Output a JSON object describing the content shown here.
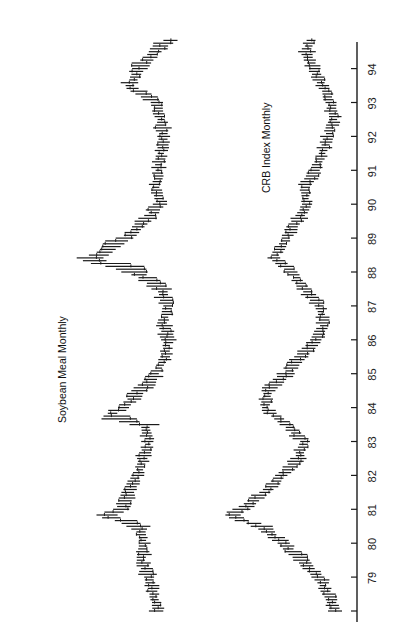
{
  "chart_data": {
    "type": "line",
    "subtype": "high-low-close bar chart (rotated 90°: time runs bottom→top, price increases right→left)",
    "title": "",
    "xlabel": "Year",
    "ylabel": "",
    "x_ticks": [
      "79",
      "80",
      "81",
      "82",
      "83",
      "84",
      "85",
      "86",
      "87",
      "88",
      "89",
      "90",
      "91",
      "92",
      "93",
      "94"
    ],
    "x_range": [
      78,
      95
    ],
    "grid": false,
    "legend": "none (series labeled inline)",
    "series": [
      {
        "name": "Soybean Meal Monthly",
        "label_position": "left of series near 1984-1986",
        "note": "relative price level (0 = low, 100 = high), estimated at start of each year",
        "x": [
          78.0,
          78.5,
          79.0,
          79.5,
          80.0,
          80.5,
          80.8,
          81.0,
          81.5,
          82.0,
          82.5,
          83.0,
          83.5,
          83.7,
          84.0,
          84.5,
          85.0,
          85.5,
          86.0,
          86.5,
          87.0,
          87.5,
          88.0,
          88.4,
          88.6,
          89.0,
          89.5,
          90.0,
          90.5,
          91.0,
          91.5,
          92.0,
          92.5,
          93.0,
          93.5,
          94.0,
          94.5,
          94.9
        ],
        "values": [
          28,
          32,
          36,
          42,
          40,
          44,
          72,
          58,
          52,
          46,
          40,
          36,
          40,
          72,
          58,
          42,
          30,
          22,
          20,
          24,
          20,
          26,
          48,
          88,
          70,
          54,
          40,
          26,
          30,
          28,
          26,
          24,
          26,
          30,
          52,
          44,
          30,
          18
        ]
      },
      {
        "name": "CRB Index Monthly",
        "label_position": "right of series near 1991-1993",
        "note": "relative price level (0 = low, 100 = high), estimated",
        "x": [
          78.0,
          78.5,
          79.0,
          79.5,
          80.0,
          80.5,
          80.8,
          81.0,
          81.5,
          82.0,
          82.5,
          83.0,
          83.5,
          84.0,
          84.5,
          85.0,
          85.5,
          86.0,
          86.5,
          87.0,
          87.5,
          88.0,
          88.4,
          89.0,
          89.5,
          90.0,
          90.5,
          91.0,
          91.5,
          92.0,
          92.5,
          93.0,
          93.5,
          94.0,
          94.5,
          94.9
        ],
        "values": [
          2,
          8,
          14,
          26,
          38,
          52,
          74,
          66,
          50,
          38,
          28,
          24,
          36,
          50,
          48,
          36,
          26,
          16,
          10,
          14,
          24,
          32,
          44,
          36,
          28,
          22,
          24,
          16,
          12,
          8,
          4,
          6,
          12,
          18,
          22,
          20
        ]
      }
    ]
  },
  "axis": {
    "ticks": [
      {
        "label": "",
        "year": 78
      },
      {
        "label": "79",
        "year": 79
      },
      {
        "label": "80",
        "year": 80
      },
      {
        "label": "81",
        "year": 81
      },
      {
        "label": "82",
        "year": 82
      },
      {
        "label": "83",
        "year": 83
      },
      {
        "label": "84",
        "year": 84
      },
      {
        "label": "85",
        "year": 85
      },
      {
        "label": "86",
        "year": 86
      },
      {
        "label": "87",
        "year": 87
      },
      {
        "label": "88",
        "year": 88
      },
      {
        "label": "89",
        "year": 89
      },
      {
        "label": "90",
        "year": 90
      },
      {
        "label": "91",
        "year": 91
      },
      {
        "label": "92",
        "year": 92
      },
      {
        "label": "93",
        "year": 93
      },
      {
        "label": "94",
        "year": 94
      }
    ]
  },
  "labels": {
    "soybean": "Soybean Meal Monthly",
    "crb": "CRB Index Monthly"
  },
  "colors": {
    "ink": "#1a1a1a",
    "background": "#ffffff"
  }
}
